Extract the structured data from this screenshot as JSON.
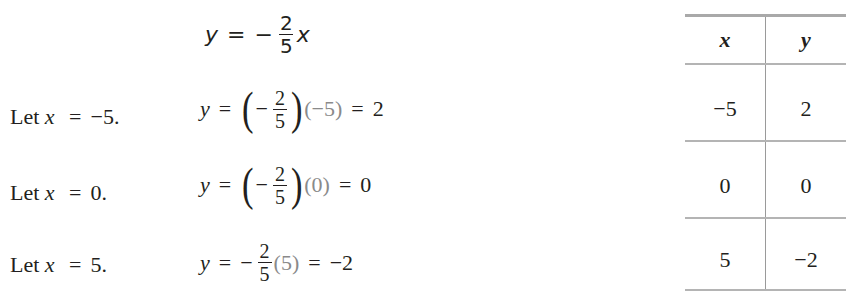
{
  "equation": {
    "lhs": "y",
    "equals": "=",
    "sign": "−",
    "fraction": {
      "numerator": "2",
      "denominator": "5"
    },
    "variable": "x"
  },
  "steps": [
    {
      "label": "Let",
      "var": "x",
      "equals": "=",
      "value": "−5.",
      "lhs": "y",
      "sign": "−",
      "fraction": {
        "numerator": "2",
        "denominator": "5"
      },
      "substituted": "−5",
      "result": "2",
      "parenthesized_fraction": true
    },
    {
      "label": "Let",
      "var": "x",
      "equals": "=",
      "value": "0.",
      "lhs": "y",
      "sign": "−",
      "fraction": {
        "numerator": "2",
        "denominator": "5"
      },
      "substituted": "0",
      "result": "0",
      "parenthesized_fraction": true
    },
    {
      "label": "Let",
      "var": "x",
      "equals": "=",
      "value": "5.",
      "lhs": "y",
      "sign": "−",
      "fraction": {
        "numerator": "2",
        "denominator": "5"
      },
      "substituted": "5",
      "result": "−2",
      "parenthesized_fraction": false
    }
  ],
  "table": {
    "headers": [
      "x",
      "y"
    ],
    "rows": [
      [
        "−5",
        "2"
      ],
      [
        "0",
        "0"
      ],
      [
        "5",
        "−2"
      ]
    ]
  },
  "colors": {
    "text": "#231f20",
    "substituted_value": "#8a8a8a",
    "rule": "#b4b4b4"
  }
}
